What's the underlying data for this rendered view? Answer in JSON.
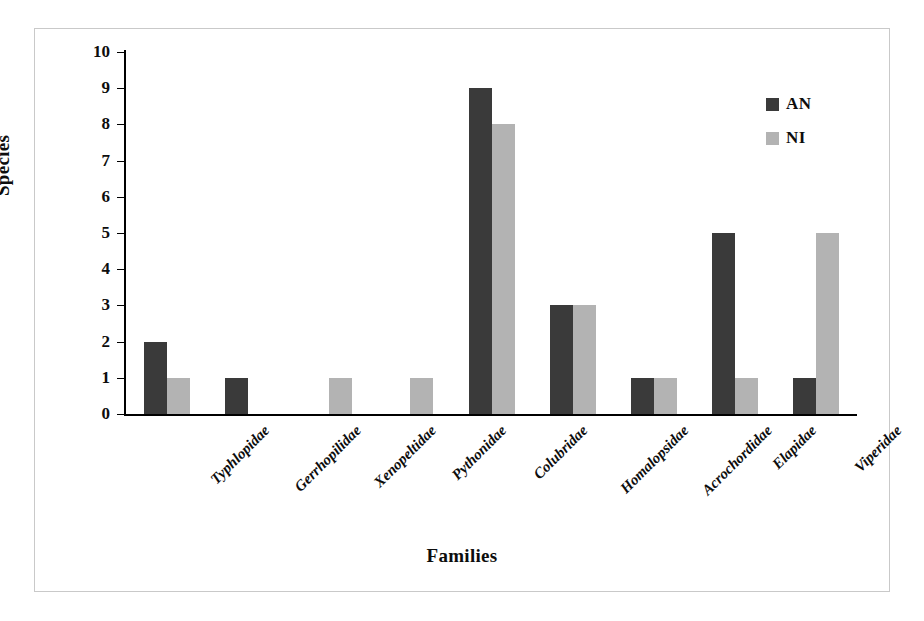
{
  "chart_data": {
    "type": "bar",
    "title": "",
    "xlabel": "Families",
    "ylabel": "Species",
    "categories": [
      "Typhlopidae",
      "Gerrhopilidae",
      "Xenopeltidae",
      "Pythonidae",
      "Colubridae",
      "Homalopsidae",
      "Acrochordidae",
      "Elapidae",
      "Viperidae"
    ],
    "series": [
      {
        "name": "AN",
        "color": "#3a3a3a",
        "values": [
          2,
          1,
          0,
          0,
          9,
          3,
          1,
          5,
          1
        ]
      },
      {
        "name": "NI",
        "color": "#b3b3b3",
        "values": [
          1,
          0,
          1,
          1,
          8,
          3,
          1,
          1,
          5
        ]
      }
    ],
    "ylim": [
      0,
      10
    ],
    "y_ticks": [
      0,
      1,
      2,
      3,
      4,
      5,
      6,
      7,
      8,
      9,
      10
    ],
    "y_tick_labels": [
      "0",
      "1",
      "2",
      "3",
      "4",
      "5",
      "6",
      "7",
      "8",
      "9",
      "10"
    ],
    "grid": false,
    "legend_position": "top-right",
    "bar_orientation": "vertical",
    "frame": "outer-box"
  },
  "axes": {
    "y_title": "Species",
    "x_title": "Families"
  },
  "legend": {
    "entries": [
      {
        "label": "AN",
        "color": "#3a3a3a"
      },
      {
        "label": "NI",
        "color": "#b3b3b3"
      }
    ]
  }
}
